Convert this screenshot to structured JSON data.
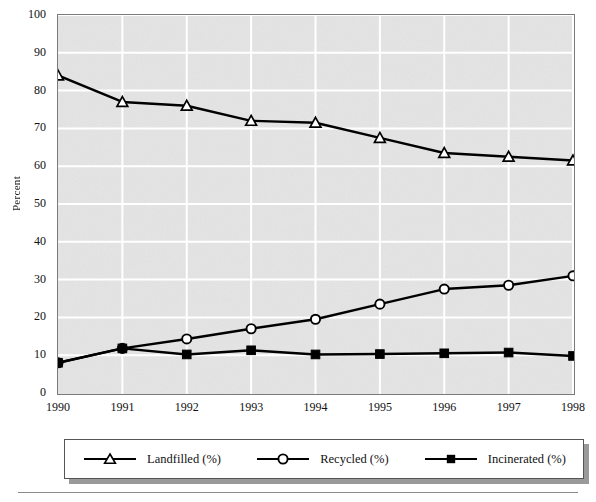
{
  "chart_data": {
    "type": "line",
    "title": "",
    "xlabel": "",
    "ylabel": "Percent",
    "categories": [
      "1990",
      "1991",
      "1992",
      "1993",
      "1994",
      "1995",
      "1996",
      "1997",
      "1998"
    ],
    "xlim": [
      1990,
      1998
    ],
    "ylim": [
      0,
      100
    ],
    "ytick_step": 10,
    "yticks": [
      "100",
      "90",
      "80",
      "70",
      "60",
      "50",
      "40",
      "30",
      "20",
      "10",
      "0"
    ],
    "grid": "horizontal and vertical white gridlines on gray panel",
    "legend_position": "below plot, horizontal, boxed with drop shadow",
    "series": [
      {
        "name": "Landfilled (%)",
        "marker": "triangle-open",
        "values": [
          84,
          77,
          76,
          72,
          71.5,
          67.5,
          63.5,
          62.5,
          61.5
        ]
      },
      {
        "name": "Recycled (%)",
        "marker": "circle-open",
        "values": [
          8,
          11.8,
          14.3,
          17,
          19.5,
          23.5,
          27.5,
          28.5,
          31
        ]
      },
      {
        "name": "Incinerated (%)",
        "marker": "square-filled",
        "values": [
          8,
          11.8,
          10.2,
          11.3,
          10.2,
          10.3,
          10.5,
          10.7,
          9.8
        ]
      }
    ]
  },
  "colors": {
    "panel": "#e4e4e4",
    "gridline": "#ffffff",
    "line": "#000000",
    "axis": "#7a7a7a",
    "text": "#111111",
    "legend_shadow": "#9a9a9a"
  },
  "legend": {
    "items": [
      {
        "label": "Landfilled (%)"
      },
      {
        "label": "Recycled (%)"
      },
      {
        "label": "Incinerated (%)"
      }
    ]
  }
}
